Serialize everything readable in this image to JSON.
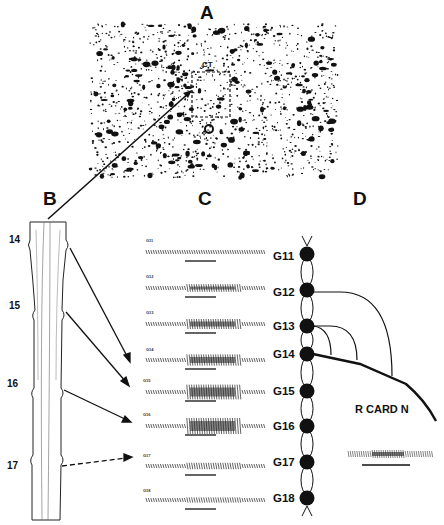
{
  "panels": {
    "A": {
      "letter": "A",
      "region_label": "CT"
    },
    "B": {
      "letter": "B",
      "segments": [
        "14",
        "15",
        "16",
        "17"
      ]
    },
    "C": {
      "letter": "C",
      "traces": [
        "G11",
        "G12",
        "G13",
        "G14",
        "G15",
        "G16",
        "G17",
        "G18"
      ]
    },
    "D": {
      "letter": "D",
      "ganglia": [
        "G11",
        "G12",
        "G13",
        "G14",
        "G15",
        "G16",
        "G17",
        "G18"
      ],
      "nerve_label": "R CARD N"
    }
  }
}
